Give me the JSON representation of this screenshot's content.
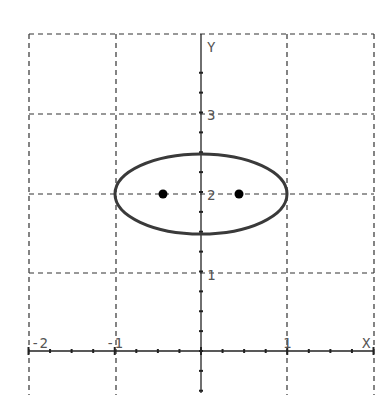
{
  "chart_data": {
    "type": "scatter",
    "title": "",
    "xlabel": "X",
    "ylabel": "Y",
    "xlim": [
      -2,
      2
    ],
    "ylim": [
      0,
      3.55
    ],
    "grid": true,
    "grid_style": "dashed",
    "x_ticks": [
      -2,
      -1,
      0,
      1,
      2
    ],
    "x_tick_labels": [
      "-2",
      "-1",
      "1"
    ],
    "y_ticks": [
      1,
      2,
      3
    ],
    "y_tick_labels": [
      "1",
      "2",
      "3"
    ],
    "minor_tick_step": 0.25,
    "series": [
      {
        "name": "ellipse",
        "kind": "curve",
        "equation": "x^2 + (y-2)^2/0.25 = 1",
        "center": [
          0,
          2
        ],
        "semi_major_x": 1,
        "semi_minor_y": 0.5
      },
      {
        "name": "points",
        "kind": "points",
        "points": [
          [
            -0.43,
            2
          ],
          [
            0.45,
            2
          ]
        ]
      }
    ]
  },
  "labels": {
    "x_axis": "X",
    "y_axis": "Y",
    "xt_m2": "-2",
    "xt_m1": "-1",
    "xt_1": "1",
    "yt_1": "1",
    "yt_2": "2",
    "yt_3": "3"
  },
  "colors": {
    "grid": "#333333",
    "axis": "#222222",
    "curve": "#3a3a3a",
    "point": "#000000",
    "label": "#555555"
  }
}
